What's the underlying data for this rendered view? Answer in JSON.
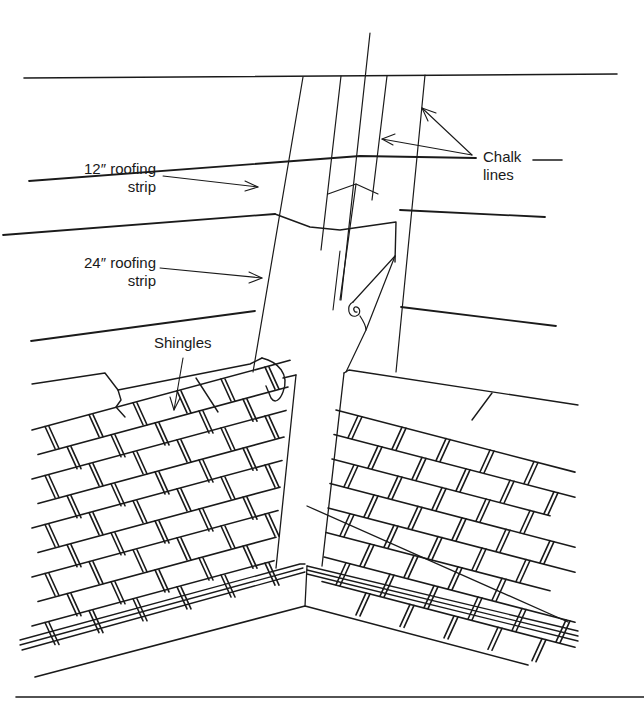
{
  "figure": {
    "type": "technical-illustration",
    "colors": {
      "ink": "#1a1a1a",
      "paper": "#ffffff"
    }
  },
  "labels": {
    "chalk_lines": {
      "line1": "Chalk",
      "line2": "lines"
    },
    "strip_12": {
      "line1": "12″ roofing",
      "line2": "strip"
    },
    "strip_24": {
      "line1": "24″ roofing",
      "line2": "strip"
    },
    "shingles": "Shingles"
  }
}
